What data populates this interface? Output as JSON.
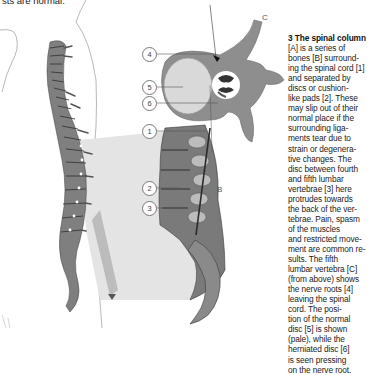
{
  "page": {
    "top_fragment": "sts are normal."
  },
  "caption": {
    "heading": "3 The spinal column",
    "lines": [
      "[A] is a series of",
      "bones [B] surround-",
      "ing the spinal cord [1]",
      "and separated by",
      "discs or cushion-",
      "like pads [2]. These",
      "may slip out of their",
      "normal place if the",
      "surrounding liga-",
      "ments tear due to",
      "strain or degenera-",
      "tive changes. The",
      "disc between fourth",
      "and fifth lumbar",
      "vertebrae [3] here",
      "protrudes towards",
      "the back of the ver-",
      "tebrae. Pain, spasm",
      "of the muscles",
      "and restricted move-",
      "ment are common re-",
      "sults. The fifth",
      "lumbar vertebra [C]",
      "(from above) shows",
      "the nerve roots [4]",
      "leaving the spinal",
      "cord. The posi-",
      "tion of the normal",
      "disc [5] is shown",
      "(pale), while the",
      "herniated disc [6]",
      "is seen pressing",
      "on the nerve root."
    ]
  },
  "illustration": {
    "title": "Spinal column with lumbar detail and vertebra cross-section",
    "labels": {
      "letter_b": "B",
      "letter_c": "C"
    },
    "callouts": [
      {
        "number": "1",
        "meaning": "spinal cord"
      },
      {
        "number": "2",
        "meaning": "disc"
      },
      {
        "number": "3",
        "meaning": "herniated lumbar disc"
      },
      {
        "number": "4",
        "meaning": "nerve roots"
      },
      {
        "number": "5",
        "meaning": "normal disc position"
      },
      {
        "number": "6",
        "meaning": "herniated disc"
      }
    ],
    "colors": {
      "bone": "#8c8c8c",
      "bone_dark": "#4a4a4a",
      "disc_pale": "#d9d9d9",
      "shadow_wedge": "#e2e2e2",
      "outline": "#9a9a9a"
    }
  }
}
